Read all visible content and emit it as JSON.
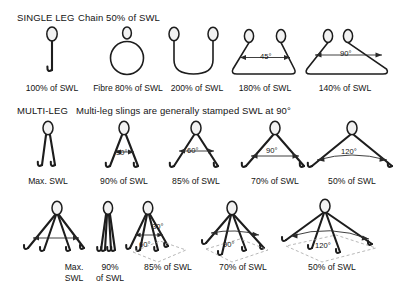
{
  "diagram": {
    "degree_symbol": "°"
  },
  "sections": {
    "single": {
      "label": "SINGLE LEG",
      "note": "Chain 50% of SWL"
    },
    "multi": {
      "label": "MULTI-LEG",
      "note": "Multi-leg slings are generally stamped SWL at 90°"
    }
  },
  "row_single": [
    {
      "name": "single-leg-vertical",
      "caption": "100% of SWL",
      "angle": ""
    },
    {
      "name": "endless-fibre-sling",
      "caption": "Fibre 80% of SWL",
      "angle": ""
    },
    {
      "name": "basket-hitch",
      "caption": "200% of SWL",
      "angle": ""
    },
    {
      "name": "basket-hitch-45",
      "caption": "180% of SWL",
      "angle": "45°"
    },
    {
      "name": "basket-hitch-90",
      "caption": "140% of SWL",
      "angle": "90°"
    }
  ],
  "row_two_leg": [
    {
      "name": "two-leg-vertical",
      "caption": "Max. SWL",
      "angle": ""
    },
    {
      "name": "two-leg-30",
      "caption": "90% of SWL",
      "angle": "30°"
    },
    {
      "name": "two-leg-60",
      "caption": "85% of SWL",
      "angle": "60°"
    },
    {
      "name": "two-leg-90",
      "caption": "70% of SWL",
      "angle": "90°"
    },
    {
      "name": "two-leg-120",
      "caption": "50% of SWL",
      "angle": "120°"
    }
  ],
  "row_four_leg": [
    {
      "name": "four-leg-spread",
      "caption_line1": "Max.",
      "caption_line2": "SWL",
      "angle": ""
    },
    {
      "name": "four-leg-vertical",
      "caption_line1": "90%",
      "caption_line2": "of SWL",
      "angle": "30°"
    },
    {
      "name": "four-leg-60",
      "caption_line1": "85% of SWL",
      "caption_line2": "",
      "angle": "60°"
    },
    {
      "name": "four-leg-90",
      "caption_line1": "70% of SWL",
      "caption_line2": "",
      "angle": "90°"
    },
    {
      "name": "four-leg-120",
      "caption_line1": "50% of SWL",
      "caption_line2": "",
      "angle": "120°"
    }
  ]
}
